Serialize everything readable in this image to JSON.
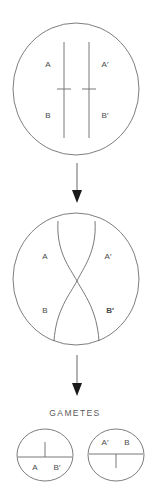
{
  "figure": {
    "title": "",
    "stages": [
      {
        "name": "paired-homologous-chromosomes",
        "cell": {
          "cx": 76,
          "cy": 89,
          "rx": 63,
          "ry": 66
        },
        "chromosomes": [
          {
            "id": "left-chromosome",
            "x": 64,
            "top": 42,
            "bottom": 138,
            "centromere_y": 89,
            "upper_label": "A",
            "lower_label": "B"
          },
          {
            "id": "right-chromosome",
            "x": 89,
            "top": 42,
            "bottom": 138,
            "centromere_y": 89,
            "upper_label": "A′",
            "lower_label": "B′"
          }
        ],
        "labels": [
          {
            "text": "A",
            "x": 48,
            "y": 65
          },
          {
            "text": "A′",
            "x": 105,
            "y": 65
          },
          {
            "text": "B",
            "x": 48,
            "y": 116
          },
          {
            "text": "B′",
            "x": 105,
            "y": 116
          }
        ]
      },
      {
        "name": "crossing-over-chiasma",
        "cell": {
          "cx": 76,
          "cy": 279,
          "rx": 63,
          "ry": 66
        },
        "chromatids": [
          {
            "id": "chromatid-a-to-b-prime",
            "d": "M 58 221 C 56 252 70 268 77 281 C 84 294 97 310 99 341"
          },
          {
            "id": "chromatid-a-prime-to-b",
            "d": "M 95 221 C 97 252 83 268 77 281 C 70 294 56 310 54 341"
          }
        ],
        "crossover_point": {
          "x": 77,
          "y": 281
        },
        "labels": [
          {
            "text": "A",
            "x": 45,
            "y": 257
          },
          {
            "text": "A′",
            "x": 108,
            "y": 257
          },
          {
            "text": "B",
            "x": 45,
            "y": 311
          },
          {
            "text": "B′",
            "x": 110,
            "y": 311
          }
        ]
      },
      {
        "name": "gametes",
        "heading": "GAMETES",
        "heading_pos": {
          "x": 75,
          "y": 414
        },
        "cells": [
          {
            "id": "gamete-left",
            "cell": {
              "cx": 45,
              "cy": 455,
              "rx": 28,
              "ry": 26
            },
            "chromosome": {
              "x": 45,
              "axis_y": 457,
              "tick_top": 442,
              "tick_bottom": 470
            },
            "labels": [
              {
                "text": "A",
                "x": 35,
                "y": 468
              },
              {
                "text": "B′",
                "x": 57,
                "y": 468
              }
            ]
          },
          {
            "id": "gamete-right",
            "cell": {
              "cx": 116,
              "cy": 455,
              "rx": 28,
              "ry": 26
            },
            "chromosome": {
              "x": 116,
              "axis_y": 454,
              "tick_top": 440,
              "tick_bottom": 468
            },
            "labels": [
              {
                "text": "A′",
                "x": 105,
                "y": 443
              },
              {
                "text": "B",
                "x": 127,
                "y": 443
              }
            ]
          }
        ]
      }
    ],
    "arrows": [
      {
        "id": "arrow-top",
        "x": 77,
        "y_start": 163,
        "y_end": 203
      },
      {
        "id": "arrow-bottom",
        "x": 77,
        "y_start": 355,
        "y_end": 396
      }
    ],
    "colors": {
      "background": "#ffffff",
      "outline": "#6e6e6e",
      "chromatid": "#6a6a6a",
      "arrow_shaft": "#757575",
      "arrow_head": "#1a1a1a",
      "label_text": "#4a4a4a",
      "heading_text": "#5a5a5a"
    }
  }
}
